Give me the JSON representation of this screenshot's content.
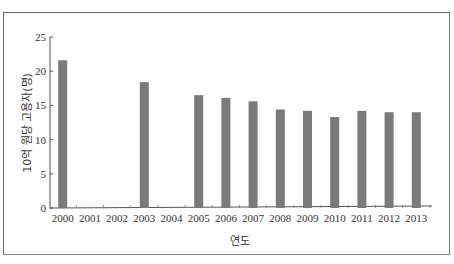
{
  "chart_data": {
    "type": "bar",
    "title": "",
    "xlabel": "연도",
    "ylabel": "10억 원당 고용자(명)",
    "ylim": [
      0,
      25
    ],
    "yticks": [
      0,
      5,
      10,
      15,
      20,
      25
    ],
    "grid": false,
    "legend": null,
    "bar_color": "#7a7a7a",
    "categories": [
      "2000",
      "2001",
      "2002",
      "2003",
      "2004",
      "2005",
      "2006",
      "2007",
      "2008",
      "2009",
      "2010",
      "2011",
      "2012",
      "2013"
    ],
    "values": [
      21.6,
      null,
      null,
      18.4,
      null,
      16.5,
      16.1,
      15.6,
      14.4,
      14.2,
      13.3,
      14.2,
      14.0,
      14.0
    ]
  }
}
